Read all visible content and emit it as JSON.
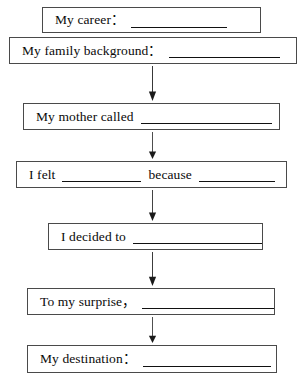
{
  "document": {
    "type": "flow-chart-worksheet",
    "title": "Story frame flow chart",
    "orientation": "vertical",
    "background_color": "#ffffff",
    "line_color": "#4a4a4a",
    "text_color": "#0a0a0a"
  },
  "boxes": [
    {
      "id": "career",
      "label": "My career:",
      "prompt_text": "My career：",
      "blank_count": 1,
      "blank_widths": [
        96
      ],
      "x": 42,
      "y": 7,
      "width": 219,
      "height": 26,
      "text_left_pad": 12
    },
    {
      "id": "family-background",
      "label": "My family background:",
      "prompt_text": "My family background：",
      "blank_count": 1,
      "blank_widths": [
        111
      ],
      "x": 9,
      "y": 37,
      "width": 288,
      "height": 27,
      "text_left_pad": 12
    },
    {
      "id": "mother-called",
      "label": "My mother called",
      "prompt_text": "My mother called",
      "blank_count": 1,
      "blank_widths": [
        131
      ],
      "x": 23,
      "y": 103,
      "width": 257,
      "height": 27,
      "text_left_pad": 12
    },
    {
      "id": "i-felt-because",
      "label": "I felt ___ because ___",
      "prompt_text": "I felt",
      "prompt_text_2": "because",
      "blank_count": 2,
      "blank_widths": [
        79,
        76
      ],
      "x": 16,
      "y": 161,
      "width": 271,
      "height": 27,
      "text_left_pad": 12
    },
    {
      "id": "i-decided-to",
      "label": "I decided to",
      "prompt_text": "I decided to",
      "blank_count": 1,
      "blank_widths": [
        136
      ],
      "x": 48,
      "y": 223,
      "width": 215,
      "height": 27,
      "text_left_pad": 12
    },
    {
      "id": "to-my-surprise",
      "label": "To my surprise,",
      "prompt_text": "To my surprise，",
      "blank_count": 1,
      "blank_widths": [
        134
      ],
      "x": 27,
      "y": 288,
      "width": 248,
      "height": 27,
      "text_left_pad": 12
    },
    {
      "id": "my-destination",
      "label": "My destination:",
      "prompt_text": "My destination：",
      "blank_count": 1,
      "blank_widths": [
        128
      ],
      "x": 27,
      "y": 345,
      "width": 250,
      "height": 28,
      "text_left_pad": 12
    }
  ],
  "arrows": [
    {
      "id": "arrow-1",
      "from": "family-background",
      "to": "mother-called",
      "x": 152,
      "y": 66,
      "length": 35
    },
    {
      "id": "arrow-2",
      "from": "mother-called",
      "to": "i-felt-because",
      "x": 152,
      "y": 132,
      "length": 27
    },
    {
      "id": "arrow-3",
      "from": "i-felt-because",
      "to": "i-decided-to",
      "x": 152,
      "y": 190,
      "length": 31
    },
    {
      "id": "arrow-4",
      "from": "i-decided-to",
      "to": "to-my-surprise",
      "x": 152,
      "y": 252,
      "length": 34
    },
    {
      "id": "arrow-5",
      "from": "to-my-surprise",
      "to": "my-destination",
      "x": 152,
      "y": 317,
      "length": 26
    }
  ]
}
